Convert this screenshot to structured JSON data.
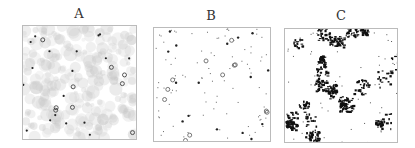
{
  "panels": [
    {
      "id": "A",
      "label": "A",
      "style": "gray cloud texture with sparse dark dots and ring markers"
    },
    {
      "id": "B",
      "label": "B",
      "style": "sparse small dots and ring markers on white"
    },
    {
      "id": "C",
      "label": "C",
      "style": "dense black clustered speckles on white"
    }
  ],
  "colors": {
    "border": "#bbbbbb",
    "dot": "#222222",
    "cloud": "#c8c8c8",
    "ring": "#444444"
  }
}
